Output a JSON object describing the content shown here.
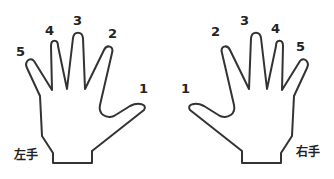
{
  "left_hand": {
    "label": "左手",
    "fingers": [
      {
        "number": "1",
        "name": "thumb"
      },
      {
        "number": "2",
        "name": "index"
      },
      {
        "number": "3",
        "name": "middle"
      },
      {
        "number": "4",
        "name": "ring"
      },
      {
        "number": "5",
        "name": "pinky"
      }
    ]
  },
  "right_hand": {
    "label": "右手",
    "fingers": [
      {
        "number": "1",
        "name": "thumb"
      },
      {
        "number": "2",
        "name": "index"
      },
      {
        "number": "3",
        "name": "middle"
      },
      {
        "number": "4",
        "name": "ring"
      },
      {
        "number": "5",
        "name": "pinky"
      }
    ]
  },
  "colors": {
    "outline": "#333333",
    "text": "#222222",
    "background": "#ffffff"
  }
}
